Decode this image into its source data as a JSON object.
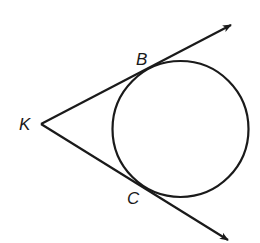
{
  "figure": {
    "type": "geometry",
    "stroke_color": "#1a1a1a",
    "background": "#ffffff",
    "circle": {
      "cx": 180.5,
      "cy": 129,
      "r": 68
    },
    "points": [
      {
        "name": "K",
        "label": "K",
        "x": 41,
        "y": 124
      },
      {
        "name": "B",
        "label": "B",
        "x": 152,
        "y": 67
      },
      {
        "name": "C",
        "label": "C",
        "x": 147,
        "y": 190
      }
    ],
    "rays": [
      {
        "from": "K",
        "through": "B",
        "end": [
          231,
          25
        ]
      },
      {
        "from": "K",
        "through": "C",
        "end": [
          228,
          240
        ]
      }
    ]
  },
  "labels": {
    "K": "K",
    "B": "B",
    "C": "C"
  }
}
